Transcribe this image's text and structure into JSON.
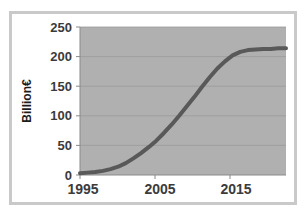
{
  "chart_data": {
    "type": "line",
    "title": "",
    "subtitle": "",
    "xlabel": "",
    "ylabel": "Billion€",
    "xlim": [
      1995,
      2022
    ],
    "ylim": [
      0,
      250
    ],
    "xticks": [
      1995,
      2005,
      2015
    ],
    "xtick_labels": [
      "1995",
      "2005",
      "2015"
    ],
    "yticks": [
      0,
      50,
      100,
      150,
      200,
      250
    ],
    "ytick_labels": [
      "0",
      "50",
      "100",
      "150",
      "200",
      "250"
    ],
    "grid": "horizontal",
    "legend": "none",
    "plot_background_color": "#b0b0b0",
    "figure_background_color": "#ffffff",
    "frame_color": "#c9c9c9",
    "line_color": "#595959",
    "line_width": 4,
    "series": [
      {
        "name": "Billion €",
        "x": [
          1995,
          1996,
          1997,
          1998,
          1999,
          2000,
          2001,
          2002,
          2003,
          2004,
          2005,
          2006,
          2007,
          2008,
          2009,
          2010,
          2011,
          2012,
          2013,
          2014,
          2015,
          2016,
          2017,
          2018,
          2019,
          2020,
          2021,
          2022
        ],
        "values": [
          3,
          4,
          5,
          7,
          10,
          14,
          20,
          28,
          37,
          47,
          58,
          71,
          85,
          100,
          116,
          132,
          149,
          165,
          180,
          192,
          202,
          208,
          211,
          212,
          213,
          213,
          214,
          214
        ]
      }
    ],
    "annotations": []
  },
  "axis": {
    "y_title": "Billion€"
  }
}
